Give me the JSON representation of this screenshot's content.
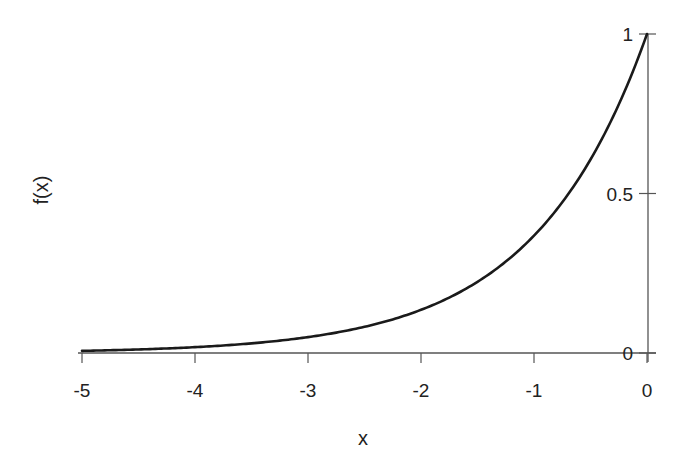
{
  "chart_data": {
    "type": "line",
    "title": "",
    "xlabel": "x",
    "ylabel": "f(x)",
    "xlim": [
      -5,
      0
    ],
    "ylim": [
      0,
      1
    ],
    "grid": false,
    "legend": null,
    "x_ticks": [
      -5,
      -4,
      -3,
      -2,
      -1,
      0
    ],
    "x_tick_labels": [
      "-5",
      "-4",
      "-3",
      "-2",
      "-1",
      "0"
    ],
    "y_ticks": [
      0,
      0.5,
      1
    ],
    "y_tick_labels": [
      "0",
      "0.5",
      "1"
    ],
    "y_axis_position": "right (at x=0)",
    "series": [
      {
        "name": "f(x) = e^x",
        "x": [
          -5,
          -4.5,
          -4,
          -3.5,
          -3,
          -2.5,
          -2,
          -1.5,
          -1,
          -0.5,
          0
        ],
        "values": [
          0.0067,
          0.0111,
          0.0183,
          0.0302,
          0.0498,
          0.0821,
          0.1353,
          0.2231,
          0.3679,
          0.6065,
          1.0
        ]
      }
    ],
    "colors": {
      "line": "#1a1a1a",
      "axis": "#555555"
    }
  }
}
